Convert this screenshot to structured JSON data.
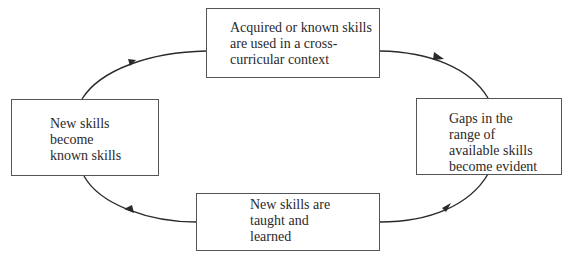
{
  "diagram": {
    "type": "cycle",
    "nodes": [
      {
        "id": "top",
        "label": "Acquired or known skills\nare used in a cross-\ncurricular context"
      },
      {
        "id": "right",
        "label": "Gaps in the\nrange of\navailable skills\nbecome evident"
      },
      {
        "id": "bottom",
        "label": "New skills are\ntaught and\nlearned"
      },
      {
        "id": "left",
        "label": "New skills\nbecome\nknown skills"
      }
    ],
    "edges": [
      {
        "from": "top",
        "to": "right"
      },
      {
        "from": "right",
        "to": "bottom"
      },
      {
        "from": "bottom",
        "to": "left"
      },
      {
        "from": "left",
        "to": "top"
      }
    ],
    "line_color": "#2a2a2a"
  }
}
